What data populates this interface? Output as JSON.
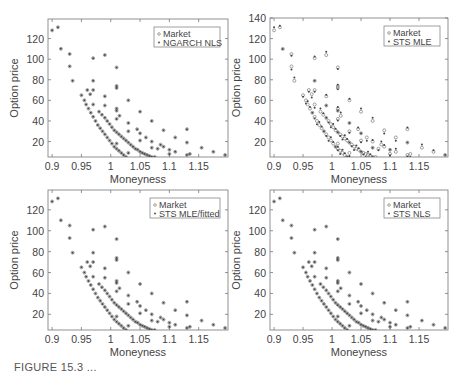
{
  "figure": {
    "caption": "FIGURE 15.3 ..."
  },
  "chart_data": [
    {
      "type": "scatter",
      "panel": "top-left",
      "title": "",
      "xlabel": "Moneyness",
      "ylabel": "Option price",
      "xlim": [
        0.893,
        1.2
      ],
      "ylim": [
        5,
        139
      ],
      "xticks": [
        "0.9",
        "0.95",
        "1",
        "1.05",
        "1.1",
        "1.15"
      ],
      "yticks": [
        "20",
        "40",
        "60",
        "80",
        "100",
        "120"
      ],
      "grid": false,
      "legend": {
        "position": "upper right",
        "entries": [
          "Market",
          "NGARCH NLS"
        ]
      },
      "series": [
        {
          "name": "Market",
          "marker": "circle"
        },
        {
          "name": "NGARCH NLS",
          "marker": "dot"
        }
      ]
    },
    {
      "type": "scatter",
      "panel": "top-right",
      "title": "",
      "xlabel": "Moneyness",
      "ylabel": "Option price",
      "xlim": [
        0.893,
        1.2
      ],
      "ylim": [
        5,
        140
      ],
      "xticks": [
        "0.9",
        "0.95",
        "1",
        "1.05",
        "1.1",
        "1.15"
      ],
      "yticks": [
        "20",
        "40",
        "60",
        "80",
        "100",
        "120",
        "140"
      ],
      "grid": false,
      "legend": {
        "position": "upper right",
        "entries": [
          "Market",
          "STS MLE"
        ]
      },
      "series": [
        {
          "name": "Market",
          "marker": "circle"
        },
        {
          "name": "STS MLE",
          "marker": "dot"
        }
      ]
    },
    {
      "type": "scatter",
      "panel": "bottom-left",
      "title": "",
      "xlabel": "Moneyness",
      "ylabel": "Option price",
      "xlim": [
        0.893,
        1.2
      ],
      "ylim": [
        5,
        139
      ],
      "xticks": [
        "0.9",
        "0.95",
        "1",
        "1.05",
        "1.1",
        "1.15"
      ],
      "yticks": [
        "20",
        "40",
        "60",
        "80",
        "100",
        "120"
      ],
      "grid": false,
      "legend": {
        "position": "upper right",
        "entries": [
          "Market",
          "STS MLE/fitted"
        ]
      },
      "series": [
        {
          "name": "Market",
          "marker": "circle"
        },
        {
          "name": "STS MLE/fitted",
          "marker": "dot"
        }
      ]
    },
    {
      "type": "scatter",
      "panel": "bottom-right",
      "title": "",
      "xlabel": "Moneyness",
      "ylabel": "Option price",
      "xlim": [
        0.893,
        1.2
      ],
      "ylim": [
        5,
        139
      ],
      "xticks": [
        "0.9",
        "0.95",
        "1",
        "1.05",
        "1.1",
        "1.15"
      ],
      "yticks": [
        "20",
        "40",
        "60",
        "80",
        "100",
        "120"
      ],
      "grid": false,
      "legend": {
        "position": "upper right",
        "entries": [
          "Market",
          "STS NLS"
        ]
      },
      "series": [
        {
          "name": "Market",
          "marker": "circle"
        },
        {
          "name": "STS NLS",
          "marker": "dot"
        }
      ]
    }
  ],
  "market_points": [
    [
      0.9,
      128
    ],
    [
      0.91,
      131
    ],
    [
      0.915,
      110
    ],
    [
      0.93,
      105
    ],
    [
      0.93,
      93
    ],
    [
      0.935,
      79
    ],
    [
      0.97,
      101
    ],
    [
      0.97,
      79
    ],
    [
      0.97,
      70
    ],
    [
      0.97,
      56
    ],
    [
      0.99,
      104
    ],
    [
      0.99,
      64
    ],
    [
      0.99,
      55
    ],
    [
      1.01,
      92
    ],
    [
      1.01,
      74
    ],
    [
      1.01,
      72
    ],
    [
      1.01,
      52
    ],
    [
      1.01,
      50
    ],
    [
      1.01,
      42
    ],
    [
      1.01,
      18
    ],
    [
      1.015,
      45
    ],
    [
      1.03,
      60
    ],
    [
      1.03,
      38
    ],
    [
      1.03,
      30
    ],
    [
      1.03,
      9
    ],
    [
      1.05,
      49
    ],
    [
      1.045,
      32
    ],
    [
      1.05,
      28
    ],
    [
      1.05,
      21
    ],
    [
      1.06,
      24
    ],
    [
      1.07,
      40
    ],
    [
      1.07,
      20
    ],
    [
      1.07,
      14
    ],
    [
      1.08,
      13
    ],
    [
      1.09,
      31
    ],
    [
      1.085,
      17
    ],
    [
      1.09,
      15
    ],
    [
      1.1,
      12
    ],
    [
      1.1,
      8
    ],
    [
      1.11,
      24
    ],
    [
      1.11,
      10
    ],
    [
      1.13,
      32
    ],
    [
      1.13,
      19
    ],
    [
      1.13,
      7
    ],
    [
      1.135,
      8
    ],
    [
      1.155,
      14
    ],
    [
      1.175,
      10
    ],
    [
      1.195,
      7
    ],
    [
      0.95,
      65
    ],
    [
      0.955,
      60
    ],
    [
      0.958,
      56
    ],
    [
      0.962,
      52
    ],
    [
      0.966,
      48
    ],
    [
      0.97,
      44
    ],
    [
      0.974,
      40
    ],
    [
      0.978,
      36
    ],
    [
      0.982,
      33
    ],
    [
      0.986,
      30
    ],
    [
      0.99,
      27
    ],
    [
      0.994,
      24
    ],
    [
      0.998,
      21
    ],
    [
      1.002,
      18
    ],
    [
      1.006,
      15
    ],
    [
      1.01,
      13
    ],
    [
      1.014,
      11
    ],
    [
      1.018,
      9
    ],
    [
      1.022,
      7
    ],
    [
      1.026,
      5
    ],
    [
      0.96,
      70
    ],
    [
      0.965,
      66
    ],
    [
      0.98,
      49
    ],
    [
      0.985,
      46
    ],
    [
      0.99,
      43
    ],
    [
      0.994,
      40
    ],
    [
      0.998,
      37
    ],
    [
      1.002,
      34
    ],
    [
      1.006,
      31
    ],
    [
      1.01,
      29
    ],
    [
      1.014,
      27
    ],
    [
      1.018,
      25
    ],
    [
      1.022,
      23
    ],
    [
      1.026,
      21
    ],
    [
      1.03,
      19
    ],
    [
      1.034,
      17
    ],
    [
      1.038,
      15
    ],
    [
      1.042,
      13
    ],
    [
      1.046,
      12
    ],
    [
      1.05,
      10
    ],
    [
      1.054,
      9
    ],
    [
      1.058,
      8
    ],
    [
      1.062,
      7
    ],
    [
      1.066,
      6
    ],
    [
      1.07,
      5
    ],
    [
      1.075,
      5
    ]
  ]
}
